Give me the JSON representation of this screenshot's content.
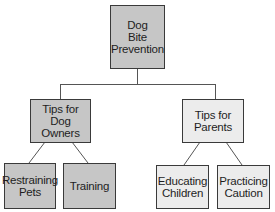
{
  "diagram": {
    "type": "tree",
    "title": "Dog Bite Prevention",
    "colors": {
      "dark_fill": "#c6c6c6",
      "light_fill": "#ececec",
      "border": "#3a3a3a",
      "line": "#555555"
    },
    "root": {
      "label": "Dog\nBite\nPrevention"
    },
    "branches": [
      {
        "label": "Tips for\nDog Owners",
        "children": [
          {
            "label": "Restraining\nPets"
          },
          {
            "label": "Training"
          }
        ]
      },
      {
        "label": "Tips for\nParents",
        "children": [
          {
            "label": "Educating\nChildren"
          },
          {
            "label": "Practicing\nCaution"
          }
        ]
      }
    ]
  }
}
